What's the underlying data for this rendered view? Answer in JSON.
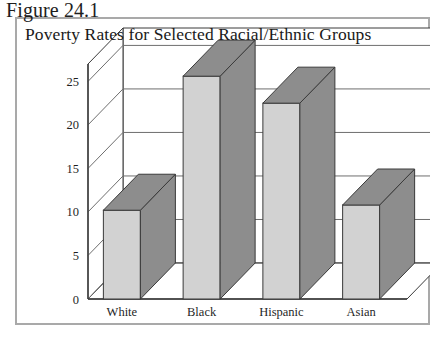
{
  "figure": {
    "label": "Figure 24.1"
  },
  "chart_data": {
    "type": "bar",
    "title": "Poverty Rates for Selected Racial/Ethnic Groups",
    "xlabel": "",
    "ylabel": "",
    "categories": [
      "White",
      "Black",
      "Hispanic",
      "Asian"
    ],
    "values": [
      10.2,
      25.6,
      22.5,
      10.8
    ],
    "ylim": [
      0,
      27
    ],
    "yticks": [
      0,
      5,
      10,
      15,
      20,
      25
    ],
    "ytick_labels": [
      "0",
      "5",
      "10",
      "15",
      "20",
      "25"
    ],
    "grid": true,
    "legend": false,
    "style": "3d-column",
    "colors": {
      "bar_front": "#d2d2d2",
      "bar_side": "#8d8d8d",
      "bar_top": "#8d8d8d",
      "bar_outline": "#3a3a3a",
      "gridline": "#6e6e6e",
      "axis": "#3a3a3a",
      "frame_border": "#a9a9a9",
      "background": "#ffffff",
      "text": "#1a1a1a"
    }
  }
}
